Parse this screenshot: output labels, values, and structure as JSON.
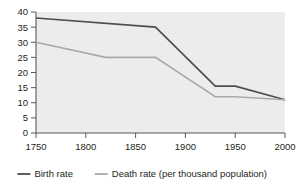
{
  "chart_data": {
    "type": "line",
    "title": "",
    "subtitle": "",
    "xlabel": "",
    "ylabel": "",
    "xlim": [
      1750,
      2000
    ],
    "ylim": [
      0,
      40
    ],
    "grid": false,
    "legend_position": "bottom",
    "x_ticks": [
      1750,
      1800,
      1850,
      1900,
      1950,
      2000
    ],
    "x_tick_labels": [
      "1750",
      "1800",
      "1850",
      "1900",
      "1950",
      "2000"
    ],
    "y_ticks": [
      0,
      5,
      10,
      15,
      20,
      25,
      30,
      35,
      40
    ],
    "y_tick_labels": [
      "0",
      "5",
      "10",
      "15",
      "20",
      "25",
      "30",
      "35",
      "40"
    ],
    "series": [
      {
        "name": "Birth rate",
        "color": "#4d4d4f",
        "x": [
          1750,
          1870,
          1930,
          1950,
          2000
        ],
        "values": [
          38,
          35,
          15.5,
          15.5,
          11
        ]
      },
      {
        "name": "Death rate (per thousand population)",
        "color": "#a7a9ac",
        "x": [
          1750,
          1820,
          1870,
          1930,
          1950,
          2000
        ],
        "values": [
          30,
          25,
          25,
          12,
          12,
          11
        ]
      }
    ]
  },
  "legend": {
    "items": [
      {
        "label": "Birth rate",
        "color": "#4d4d4f"
      },
      {
        "label": "Death rate (per thousand population)",
        "color": "#a7a9ac"
      }
    ]
  },
  "colors": {
    "plot_background": "#ececec",
    "axis": "#58595b",
    "text": "#231f20",
    "birth_rate": "#4d4d4f",
    "death_rate": "#a7a9ac"
  }
}
